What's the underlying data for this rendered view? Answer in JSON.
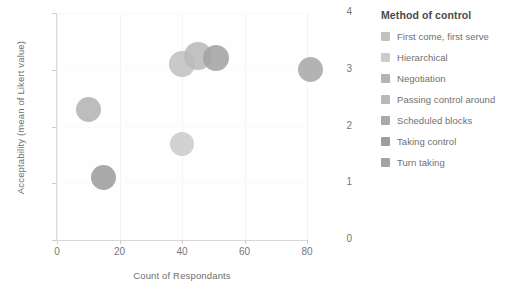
{
  "chart_data": {
    "type": "scatter",
    "title": "",
    "xlabel": "Count of Respondants",
    "ylabel": "Acceptability (mean of Likert value)",
    "xlim": [
      0,
      80
    ],
    "ylim": [
      0,
      4
    ],
    "xticks": [
      "0",
      "20",
      "40",
      "60",
      "80"
    ],
    "yticks": [
      "0",
      "1",
      "2",
      "3",
      "4"
    ],
    "grid": true,
    "legend_position": "right",
    "legend_title": "Method of control",
    "series": [
      {
        "name": "First come, first serve",
        "x": 40,
        "y": 3.1,
        "size": 26,
        "color": "#c2c2c2"
      },
      {
        "name": "Hierarchical",
        "x": 40,
        "y": 1.7,
        "size": 24,
        "color": "#cccccc"
      },
      {
        "name": "Negotiation",
        "x": 10,
        "y": 2.3,
        "size": 25,
        "color": "#b4b4b4"
      },
      {
        "name": "Passing control around",
        "x": 45,
        "y": 3.25,
        "size": 28,
        "color": "#b9b9b9"
      },
      {
        "name": "Scheduled blocks",
        "x": 81,
        "y": 3.0,
        "size": 25,
        "color": "#a9a9a9"
      },
      {
        "name": "Taking control",
        "x": 15,
        "y": 1.1,
        "size": 25,
        "color": "#9d9d9d"
      },
      {
        "name": "Turn taking",
        "x": 51,
        "y": 3.2,
        "size": 26,
        "color": "#a3a3a3"
      }
    ]
  },
  "legend": {
    "title": "Method of control",
    "items": [
      {
        "label": "First come, first serve",
        "color": "#c2c2c2"
      },
      {
        "label": "Hierarchical",
        "color": "#cccccc"
      },
      {
        "label": "Negotiation",
        "color": "#b4b4b4"
      },
      {
        "label": "Passing control around",
        "color": "#b9b9b9"
      },
      {
        "label": "Scheduled blocks",
        "color": "#a9a9a9"
      },
      {
        "label": "Taking control",
        "color": "#9d9d9d"
      },
      {
        "label": "Turn taking",
        "color": "#a3a3a3"
      }
    ]
  }
}
